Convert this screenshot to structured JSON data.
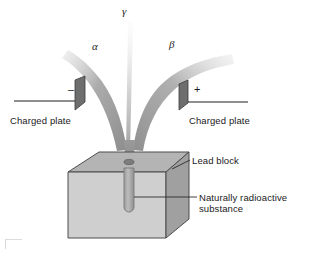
{
  "figure": {
    "width": 313,
    "height": 255,
    "background": "#ffffff"
  },
  "beams": [
    {
      "id": "alpha",
      "symbol": "α",
      "label": "alpha particle beam",
      "deflection": "left",
      "color": "#8a8a8a",
      "attracted_to": "negative plate"
    },
    {
      "id": "gamma",
      "symbol": "γ",
      "label": "gamma ray beam",
      "deflection": "none",
      "color": "#c8c8c8",
      "attracted_to": "undeflected"
    },
    {
      "id": "beta",
      "symbol": "β",
      "label": "beta particle beam",
      "deflection": "right",
      "color": "#9a9a9a",
      "attracted_to": "positive plate"
    }
  ],
  "plates": {
    "left": {
      "sign": "–",
      "label": "Charged plate",
      "polarity": "negative",
      "color": "#6e6e6e"
    },
    "right": {
      "sign": "+",
      "label": "Charged plate",
      "polarity": "positive",
      "color": "#6e6e6e"
    }
  },
  "block": {
    "label": "Lead block",
    "top_face_color": "#b4b4b4",
    "front_face_color": "#cfcfcf",
    "side_face_color": "#a0a0a0",
    "outline_color": "#4d4d4d"
  },
  "sample": {
    "label_line1": "Naturally radioactive",
    "label_line2": "substance",
    "cavity_color": "#b0b0b0"
  }
}
